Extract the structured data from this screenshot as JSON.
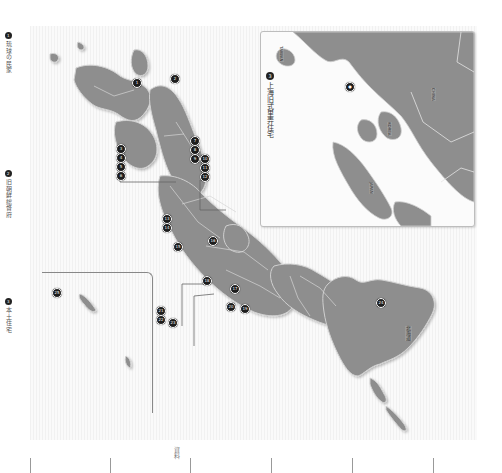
{
  "page": {
    "orientation": "rotated-90-clockwise",
    "background": "#ffffff",
    "land_color": "#8e8e8e",
    "land_border_color": "#cfcfcf",
    "sea_stripe_color": "#f1f1f1",
    "marker_color": "#1d1d1d"
  },
  "margin_labels": [
    {
      "num": "1",
      "label": "琉球の民家"
    },
    {
      "num": "2",
      "label": "旧朝鮮総督府"
    },
    {
      "num": "3",
      "label": "本土住宅"
    }
  ],
  "inset": {
    "title_num": "3",
    "title": "上海旧式里弄住宅",
    "labels": [
      "TAIWAN",
      "CHINA",
      "KOREA",
      "JAPAN"
    ]
  },
  "map": {
    "title": "日本地図",
    "main_island_label": "北海道",
    "markers": [
      {
        "id": "m1",
        "num": "1"
      },
      {
        "id": "m2",
        "num": "2"
      },
      {
        "id": "m3",
        "num": "3"
      },
      {
        "id": "m4",
        "num": "4"
      },
      {
        "id": "m5",
        "num": "5"
      },
      {
        "id": "m6",
        "num": "6"
      },
      {
        "id": "m7",
        "num": "7"
      },
      {
        "id": "m8",
        "num": "8"
      },
      {
        "id": "m9",
        "num": "9"
      },
      {
        "id": "m10",
        "num": "10"
      },
      {
        "id": "m11",
        "num": "11"
      },
      {
        "id": "m12",
        "num": "12"
      },
      {
        "id": "m13",
        "num": "13"
      },
      {
        "id": "m14",
        "num": "14"
      },
      {
        "id": "m15",
        "num": "15"
      },
      {
        "id": "m16",
        "num": "16"
      },
      {
        "id": "m17",
        "num": "17"
      },
      {
        "id": "m18",
        "num": "18"
      },
      {
        "id": "m19",
        "num": "19"
      },
      {
        "id": "m20",
        "num": "20"
      },
      {
        "id": "m21",
        "num": "21"
      },
      {
        "id": "m22",
        "num": "22"
      },
      {
        "id": "m23",
        "num": "23"
      },
      {
        "id": "m24",
        "num": "24"
      },
      {
        "id": "m25",
        "num": "25"
      }
    ]
  },
  "footer": {
    "ruler_label": "資料"
  }
}
